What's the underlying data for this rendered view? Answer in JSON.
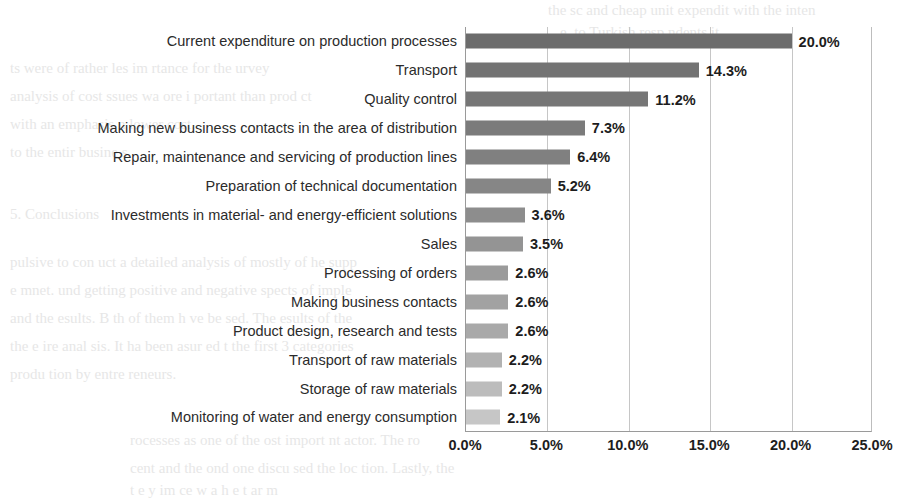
{
  "chart_data": {
    "type": "bar",
    "orientation": "horizontal",
    "title": "",
    "xlabel": "",
    "ylabel": "",
    "xlim": [
      0,
      25
    ],
    "grid": true,
    "legend": null,
    "tick_labels": [
      "0.0%",
      "5.0%",
      "10.0%",
      "15.0%",
      "20.0%",
      "25.0%"
    ],
    "tick_values": [
      0,
      5,
      10,
      15,
      20,
      25
    ],
    "categories": [
      "Current expenditure on production processes",
      "Transport",
      "Quality control",
      "Making new business contacts in the area of distribution",
      "Repair, maintenance and servicing of production lines",
      "Preparation of technical documentation",
      "Investments in material- and energy-efficient solutions",
      "Sales",
      "Processing of orders",
      "Making business contacts",
      "Product design, research and tests",
      "Transport of raw materials",
      "Storage of raw materials",
      "Monitoring of water and energy consumption"
    ],
    "values": [
      20.0,
      14.3,
      11.2,
      7.3,
      6.4,
      5.2,
      3.6,
      3.5,
      2.6,
      2.6,
      2.6,
      2.2,
      2.2,
      2.1
    ],
    "value_labels": [
      "20.0%",
      "14.3%",
      "11.2%",
      "7.3%",
      "6.4%",
      "5.2%",
      "3.6%",
      "3.5%",
      "2.6%",
      "2.6%",
      "2.6%",
      "2.2%",
      "2.2%",
      "2.1%"
    ],
    "bar_colors": [
      "#6c6c6c",
      "#737373",
      "#767676",
      "#7b7b7b",
      "#808080",
      "#868686",
      "#8d8d8d",
      "#949494",
      "#9b9b9b",
      "#a2a2a2",
      "#a9a9a9",
      "#b2b2b2",
      "#bcbcbc",
      "#c6c6c6"
    ],
    "axis_color": "#9a9a9a",
    "gridline_color": "#c6c6c6",
    "text_color": "#1d1d1d"
  },
  "background_bleed": [
    {
      "text": "the sc  and cheap unit expendit  with the inten",
      "x": 548,
      "y": 2,
      "size": 15
    },
    {
      "text": "e, to Turkish resp  ndents it",
      "x": 560,
      "y": 24,
      "size": 15
    },
    {
      "text": "ts were of  rather les  im  rtance for the  urvey",
      "x": 10,
      "y": 60,
      "size": 15
    },
    {
      "text": "analysis of cost  ssues wa  ore i  portant than prod ct",
      "x": 10,
      "y": 88,
      "size": 15
    },
    {
      "text": "with an emphasis  n lower  cost.",
      "x": 10,
      "y": 116,
      "size": 15
    },
    {
      "text": "to the entir  busine  s.",
      "x": 10,
      "y": 144,
      "size": 15
    },
    {
      "text": "5.  Conclusions",
      "x": 10,
      "y": 206,
      "size": 15
    },
    {
      "text": "pulsive to con  uct a detailed analysis of  mostly of  he supp",
      "x": 10,
      "y": 254,
      "size": 15
    },
    {
      "text": "e mnet.  und getting positive  and negative  spects of imple",
      "x": 10,
      "y": 282,
      "size": 15
    },
    {
      "text": "and the  esults. B  th of them h  ve be  sed. The  esults of the",
      "x": 10,
      "y": 310,
      "size": 15
    },
    {
      "text": "the e  ire anal  sis.  It ha  been  asur  ed  t the  first 3 categories",
      "x": 10,
      "y": 338,
      "size": 15
    },
    {
      "text": "produ  tion  by entre  reneurs.",
      "x": 10,
      "y": 366,
      "size": 15
    },
    {
      "text": "rocesses  as one of the  ost import  nt  actor. The  ro",
      "x": 130,
      "y": 432,
      "size": 15
    },
    {
      "text": "cent  and the   ond  one  discu  sed the  loc  tion.  Lastly,  the",
      "x": 130,
      "y": 460,
      "size": 15
    },
    {
      "text": "t  e   y  im  ce  w  a  h  e  t  ar  m",
      "x": 130,
      "y": 482,
      "size": 15
    }
  ]
}
